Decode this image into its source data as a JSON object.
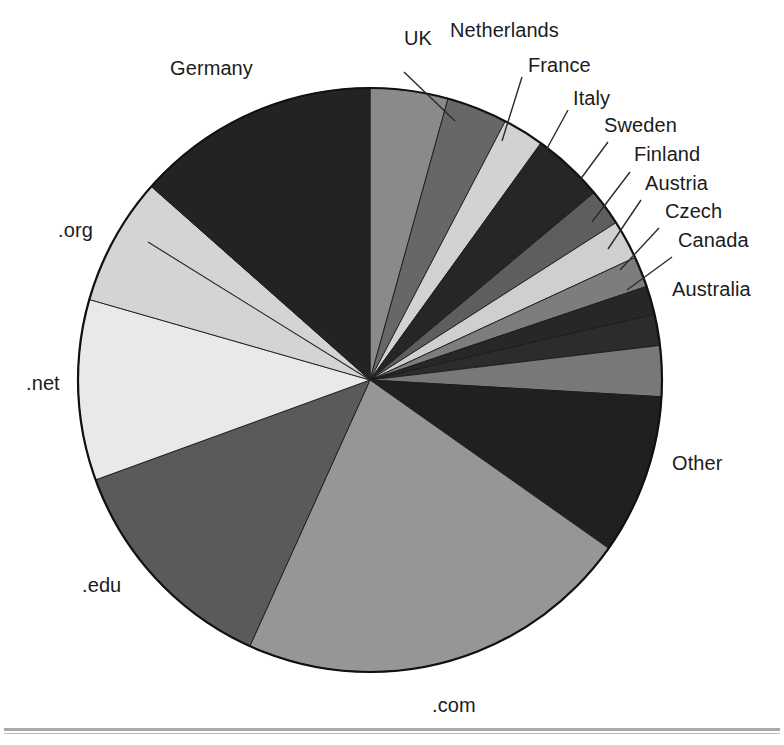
{
  "figure": {
    "background_color": "#ffffff",
    "outline_color": "#111111",
    "label_color": "#1c1c1c",
    "leader_line_color": "#2b2b2b",
    "has_bottom_rule": true
  },
  "chart_data": {
    "type": "pie",
    "title": "",
    "subtitle": "",
    "xlabel": "",
    "ylabel": "",
    "legend_position": "none",
    "labels_position": "outside-with-leader-lines",
    "grid": false,
    "start_angle_deg": 0,
    "direction": "clockwise",
    "center_px": [
      370,
      380
    ],
    "radius_px": 292,
    "categories": [
      "UK",
      "Netherlands",
      "France",
      "Italy",
      "Sweden",
      "Finland",
      "Austria",
      "Czech",
      "Canada",
      "Australia",
      "Other",
      ".com",
      ".edu",
      ".net",
      ".org",
      "Germany"
    ],
    "values": [
      4.3,
      3.4,
      2.3,
      4.0,
      2.0,
      2.2,
      1.7,
      1.6,
      1.7,
      2.8,
      8.9,
      22.0,
      12.7,
      10.0,
      7.1,
      13.3
    ],
    "units": "percent",
    "slices": [
      {
        "label": "UK",
        "value": 4.3,
        "start_deg": 0.0,
        "end_deg": 15.5,
        "color": "#8a8a8a"
      },
      {
        "label": "Netherlands",
        "value": 3.4,
        "start_deg": 15.5,
        "end_deg": 27.6,
        "color": "#676767"
      },
      {
        "label": "France",
        "value": 2.3,
        "start_deg": 27.6,
        "end_deg": 35.8,
        "color": "#d2d2d2"
      },
      {
        "label": "Italy",
        "value": 4.0,
        "start_deg": 35.8,
        "end_deg": 50.1,
        "color": "#262626"
      },
      {
        "label": "Sweden",
        "value": 2.0,
        "start_deg": 50.1,
        "end_deg": 57.4,
        "color": "#5e5e5e"
      },
      {
        "label": "Finland",
        "value": 2.2,
        "start_deg": 57.4,
        "end_deg": 65.2,
        "color": "#cfcfcf"
      },
      {
        "label": "Austria",
        "value": 1.7,
        "start_deg": 65.2,
        "end_deg": 71.3,
        "color": "#7d7d7d"
      },
      {
        "label": "Czech",
        "value": 1.6,
        "start_deg": 71.3,
        "end_deg": 77.0,
        "color": "#272727"
      },
      {
        "label": "Canada",
        "value": 1.7,
        "start_deg": 77.0,
        "end_deg": 83.2,
        "color": "#2c2c2c"
      },
      {
        "label": "Australia",
        "value": 2.8,
        "start_deg": 83.2,
        "end_deg": 93.3,
        "color": "#787878"
      },
      {
        "label": "Other",
        "value": 8.9,
        "start_deg": 93.3,
        "end_deg": 125.2,
        "color": "#202020"
      },
      {
        "label": ".com",
        "value": 22.0,
        "start_deg": 125.2,
        "end_deg": 204.3,
        "color": "#969696"
      },
      {
        "label": ".edu",
        "value": 12.7,
        "start_deg": 204.3,
        "end_deg": 250.0,
        "color": "#5a5a5a"
      },
      {
        "label": ".net",
        "value": 10.0,
        "start_deg": 250.0,
        "end_deg": 286.0,
        "color": "#e9e9e9"
      },
      {
        "label": ".org",
        "value": 7.1,
        "start_deg": 286.0,
        "end_deg": 311.5,
        "color": "#d4d4d4"
      },
      {
        "label": "Germany",
        "value": 13.3,
        "start_deg": 311.5,
        "end_deg": 360.0,
        "color": "#232323"
      }
    ]
  },
  "labels": {
    "germany": "Germany",
    "uk": "UK",
    "netherlands": "Netherlands",
    "france": "France",
    "italy": "Italy",
    "sweden": "Sweden",
    "finland": "Finland",
    "austria": "Austria",
    "czech": "Czech",
    "canada": "Canada",
    "australia": "Australia",
    "other": "Other",
    "com": ".com",
    "edu": ".edu",
    "net": ".net",
    "org": ".org"
  }
}
